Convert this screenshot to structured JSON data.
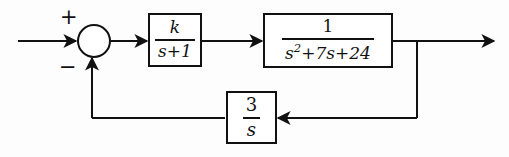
{
  "diagram": {
    "type": "control-block-diagram",
    "background_color": "#fdfdfd",
    "line_color": "#111111",
    "summing_junction": {
      "name": "summing-junction",
      "shape": "circle",
      "input_sign": "+",
      "feedback_sign": "−"
    },
    "blocks": [
      {
        "id": "plant1",
        "numerator": "k",
        "denominator": "s+1",
        "transfer_function": "k/(s+1)"
      },
      {
        "id": "plant2",
        "numerator": "1",
        "denominator_prefix": "s",
        "denominator_exponent": "2",
        "denominator_suffix": "+7s+24",
        "transfer_function": "1/(s^2+7s+24)"
      },
      {
        "id": "feedback",
        "numerator": "3",
        "denominator": "s",
        "transfer_function": "3/s"
      }
    ],
    "signals": {
      "input_label": "",
      "output_label": ""
    }
  }
}
